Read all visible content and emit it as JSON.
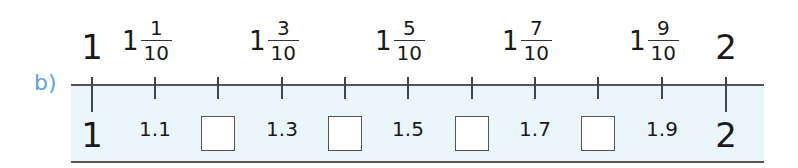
{
  "exercise": {
    "label": "b)"
  },
  "number_line": {
    "start": "1",
    "end": "2",
    "ticks_x": [
      92,
      155,
      218,
      282,
      345,
      408,
      472,
      535,
      598,
      662,
      726
    ],
    "top_labels": [
      {
        "type": "whole",
        "text": "1",
        "x": 92
      },
      {
        "type": "mixed",
        "whole": "1",
        "num": "1",
        "den": "10",
        "x": 155
      },
      {
        "type": "mixed",
        "whole": "1",
        "num": "3",
        "den": "10",
        "x": 282
      },
      {
        "type": "mixed",
        "whole": "1",
        "num": "5",
        "den": "10",
        "x": 408
      },
      {
        "type": "mixed",
        "whole": "1",
        "num": "7",
        "den": "10",
        "x": 535
      },
      {
        "type": "mixed",
        "whole": "1",
        "num": "9",
        "den": "10",
        "x": 662
      },
      {
        "type": "whole",
        "text": "2",
        "x": 726
      }
    ],
    "bottom_labels": [
      {
        "type": "whole",
        "text": "1",
        "x": 92
      },
      {
        "type": "decimal",
        "text": "1.1",
        "x": 155
      },
      {
        "type": "box",
        "text": "",
        "x": 218
      },
      {
        "type": "decimal",
        "text": "1.3",
        "x": 282
      },
      {
        "type": "box",
        "text": "",
        "x": 345
      },
      {
        "type": "decimal",
        "text": "1.5",
        "x": 408
      },
      {
        "type": "box",
        "text": "",
        "x": 472
      },
      {
        "type": "decimal",
        "text": "1.7",
        "x": 535
      },
      {
        "type": "box",
        "text": "",
        "x": 598
      },
      {
        "type": "decimal",
        "text": "1.9",
        "x": 662
      },
      {
        "type": "whole",
        "text": "2",
        "x": 726
      }
    ]
  },
  "colors": {
    "label": "#5aa6dc",
    "band": "#eaf5fc",
    "line": "#555555"
  }
}
